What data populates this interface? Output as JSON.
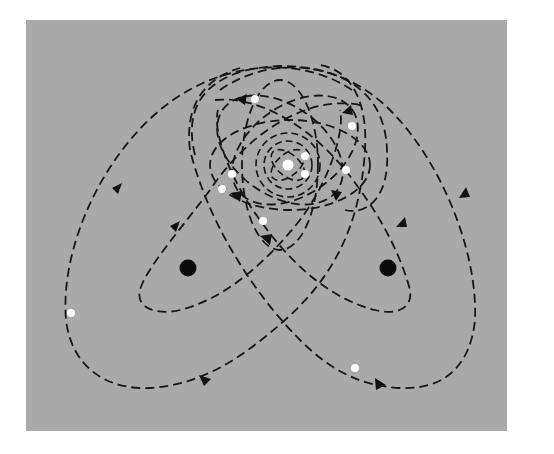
{
  "figure": {
    "background_color": "#a9a9a9",
    "orbit_color": "#161616",
    "mass_color": "#0a0a0a",
    "star_color": "#ffffff",
    "panel": {
      "x": 26,
      "y": 20,
      "width": 481,
      "height": 411
    },
    "masses": [
      {
        "name": "left-mass",
        "cx": 188,
        "cy": 268,
        "r": 8
      },
      {
        "name": "right-mass",
        "cx": 388,
        "cy": 268,
        "r": 8
      }
    ],
    "stars": [
      {
        "cx": 71,
        "cy": 313,
        "r": 4
      },
      {
        "cx": 255,
        "cy": 99,
        "r": 4
      },
      {
        "cx": 352,
        "cy": 126,
        "r": 4
      },
      {
        "cx": 288,
        "cy": 165,
        "r": 5.5
      },
      {
        "cx": 305,
        "cy": 156,
        "r": 4
      },
      {
        "cx": 305,
        "cy": 174,
        "r": 4
      },
      {
        "cx": 232,
        "cy": 174,
        "r": 4
      },
      {
        "cx": 222,
        "cy": 189,
        "r": 4
      },
      {
        "cx": 346,
        "cy": 170,
        "r": 4
      },
      {
        "cx": 263,
        "cy": 221,
        "r": 4
      },
      {
        "cx": 355,
        "cy": 368,
        "r": 4
      }
    ],
    "legend": []
  }
}
